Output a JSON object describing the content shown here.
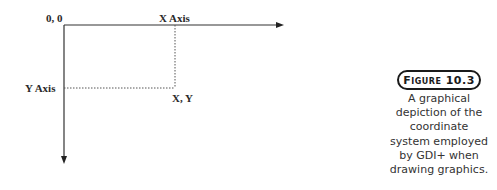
{
  "diagram": {
    "labels": {
      "origin": "0, 0",
      "x_axis": "X Axis",
      "y_axis": "Y Axis",
      "point": "X, Y"
    },
    "colors": {
      "line": "#333333",
      "dotted": "#555555",
      "text": "#2a2a2a"
    }
  },
  "figure": {
    "badge": "Figure 10.3",
    "caption": "A graphical depiction of the coordinate system employed by GDI+ when drawing graphics."
  }
}
